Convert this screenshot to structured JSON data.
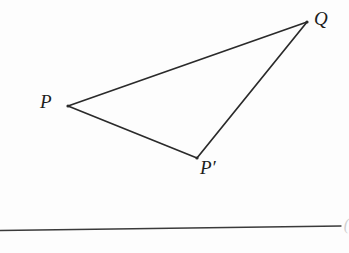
{
  "figure": {
    "kind": "geometry-diagram",
    "background_color": "#fdfdfd",
    "stroke_color": "#2a2a2a",
    "label_color": "#1c1c1c",
    "baseline_color": "#3a3a3a"
  },
  "points": {
    "P": {
      "label": "P",
      "x": 68,
      "y": 106
    },
    "Q": {
      "label": "Q",
      "x": 307,
      "y": 22
    },
    "P_prime": {
      "label": "P′",
      "x": 197,
      "y": 158
    }
  },
  "edges": [
    {
      "name": "P-to-Q",
      "from": "P",
      "to": "Q"
    },
    {
      "name": "Q-to-P-prime",
      "from": "Q",
      "to": "P_prime"
    },
    {
      "name": "P-prime-to-P",
      "from": "P_prime",
      "to": "P"
    }
  ],
  "baseline": {
    "name": "ground-line",
    "x1": 0,
    "y1": 230,
    "x2": 341,
    "y2": 226,
    "end_mark": "("
  },
  "caption": {
    "text": "",
    "visible_fragment": ""
  }
}
